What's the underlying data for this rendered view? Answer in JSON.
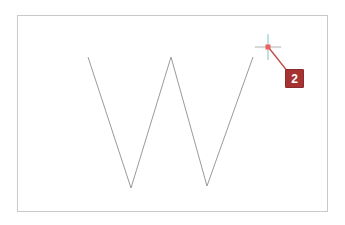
{
  "canvas": {
    "name": "drawing-canvas",
    "background_color": "#ffffff",
    "border_color": "#c9c9c9",
    "bounds": {
      "x": 17,
      "y": 15,
      "width": 311,
      "height": 197
    }
  },
  "shape": {
    "name": "w-polyline",
    "stroke_color": "#9a9a9a",
    "stroke_width": 1,
    "points": "88,57 131,188 171,57 207,186 253,57"
  },
  "cursor": {
    "name": "crosshair-cursor",
    "x": 268,
    "y": 47,
    "center_dot_color": "#e8615f",
    "vertical_arm_color": "#7fc6c6",
    "horizontal_arm_color": "#b0b0b0",
    "arm_length": 13
  },
  "leader": {
    "name": "annotation-leader-line",
    "color": "#c0504d",
    "from_x": 269,
    "from_y": 48,
    "to_x": 287,
    "to_y": 71
  },
  "annotation": {
    "label": "2",
    "fill_color": "#a63232",
    "border_color": "#8d2a2a",
    "text_color": "#ffffff"
  }
}
